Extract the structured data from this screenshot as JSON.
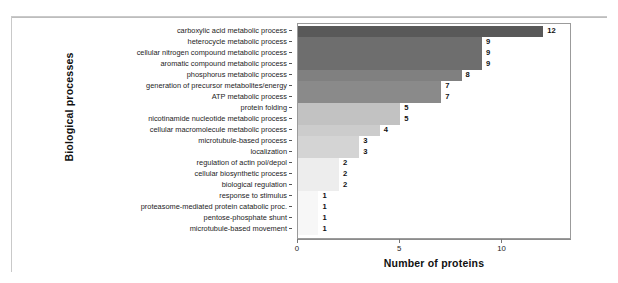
{
  "chart_data": {
    "type": "bar",
    "orientation": "horizontal",
    "title": "",
    "xlabel": "Number of proteins",
    "ylabel": "Biological processes",
    "xlim": [
      0,
      13.4
    ],
    "xticks": [
      0,
      5,
      10
    ],
    "xtick_labels": [
      "0",
      "5",
      "10"
    ],
    "grid": false,
    "legend": null,
    "categories": [
      "carboxylic acid metabolic process",
      "heterocycle metabolic process",
      "cellular nitrogen compound metabolic process",
      "aromatic compound metabolic process",
      "phosphorus metabolic process",
      "generation of precursor metabolites/energy",
      "ATP metabolic process",
      "protein folding",
      "nicotinamide nucleotide metabolic process",
      "cellular macromolecule metabolic process",
      "microtubule-based process",
      "localization",
      "regulation of actin pol/depol",
      "cellular biosynthetic process",
      "biological regulation",
      "response to stimulus",
      "proteasome-mediated protein catabolic proc.",
      "pentose-phosphate shunt",
      "microtubule-based movement"
    ],
    "values": [
      12,
      9,
      9,
      9,
      8,
      7,
      7,
      5,
      5,
      4,
      3,
      3,
      2,
      2,
      2,
      1,
      1,
      1,
      1
    ],
    "value_labels": [
      "12",
      "9",
      "9",
      "9",
      "8",
      "7",
      "7",
      "5",
      "5",
      "4",
      "3",
      "3",
      "2",
      "2",
      "2",
      "1",
      "1",
      "1",
      "1"
    ],
    "bar_colors": [
      "#595959",
      "#6e6e6e",
      "#6e6e6e",
      "#6e6e6e",
      "#808080",
      "#8a8a8a",
      "#8a8a8a",
      "#c2c2c2",
      "#c2c2c2",
      "#cccccc",
      "#d4d4d4",
      "#d4d4d4",
      "#ededed",
      "#ededed",
      "#ededed",
      "#f7f7f7",
      "#f7f7f7",
      "#f7f7f7",
      "#f7f7f7"
    ]
  }
}
